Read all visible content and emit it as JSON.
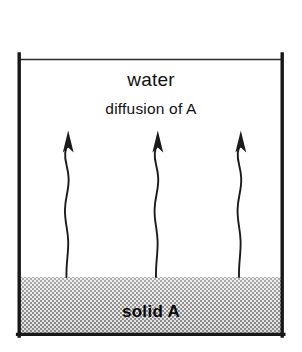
{
  "figure": {
    "background_color": "#ffffff",
    "line_color": "#1a1a1a",
    "hatch_color": "#9a9a9a"
  },
  "labels": {
    "water": "water",
    "diffusion": "diffusion of A",
    "solid": "solid A"
  },
  "vessel": {
    "left_wall_x": 18,
    "right_wall_x": 283,
    "top_y": 55,
    "bottom_y": 336,
    "water_surface_y": 59,
    "solid_top_y": 277
  },
  "arrows": {
    "count": 3,
    "direction": "up",
    "tip_y": 131,
    "tail_y": 277,
    "x_positions": [
      67,
      157,
      240
    ],
    "style": "wavy"
  }
}
